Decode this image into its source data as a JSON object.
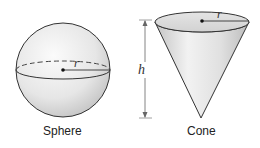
{
  "figures": [
    {
      "name": "sphere",
      "caption": "Sphere",
      "radius_label": "r"
    },
    {
      "name": "cone",
      "caption": "Cone",
      "radius_label": "r",
      "height_label": "h"
    }
  ],
  "colors": {
    "fill_light": "#f4f4f4",
    "fill_dark": "#c8c8c8",
    "stroke": "#333333"
  }
}
